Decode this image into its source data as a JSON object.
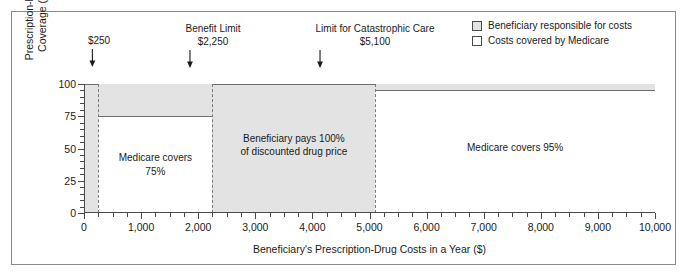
{
  "chart_data": {
    "type": "area",
    "title": "",
    "xlabel": "Beneficiary's Prescription-Drug Costs in a Year ($)",
    "ylabel_line1": "Prescription-Drug",
    "ylabel_line2": "Coverage (%)",
    "xlim": [
      0,
      10000
    ],
    "ylim": [
      0,
      100
    ],
    "xticks": [
      0,
      1000,
      2000,
      3000,
      4000,
      5000,
      6000,
      7000,
      8000,
      9000,
      10000
    ],
    "xtick_labels": [
      "0",
      "1,000",
      "2,000",
      "3,000",
      "4,000",
      "5,000",
      "6,000",
      "7,000",
      "8,000",
      "9,000",
      "10,000"
    ],
    "x_minor_step": 250,
    "yticks": [
      0,
      25,
      50,
      75,
      100
    ],
    "ytick_labels": [
      "0",
      "25",
      "50",
      "75",
      "100"
    ],
    "y_minor_step": 5,
    "grid": false,
    "legend_position": "top-right",
    "series": [
      {
        "name": "Costs covered by Medicare",
        "description": "Medicare prescription-drug coverage as a percent of the beneficiary's annual drug costs",
        "steps": [
          {
            "x_start": 0,
            "x_end": 250,
            "coverage_pct": 0
          },
          {
            "x_start": 250,
            "x_end": 2250,
            "coverage_pct": 75
          },
          {
            "x_start": 2250,
            "x_end": 5100,
            "coverage_pct": 0
          },
          {
            "x_start": 5100,
            "x_end": 10000,
            "coverage_pct": 95
          }
        ]
      },
      {
        "name": "Beneficiary responsible for costs",
        "description": "Shaded area above the coverage line; share of drug costs paid by the beneficiary",
        "steps": [
          {
            "x_start": 0,
            "x_end": 250,
            "beneficiary_pct": 100
          },
          {
            "x_start": 250,
            "x_end": 2250,
            "beneficiary_pct": 25
          },
          {
            "x_start": 2250,
            "x_end": 5100,
            "beneficiary_pct": 100
          },
          {
            "x_start": 5100,
            "x_end": 10000,
            "beneficiary_pct": 5
          }
        ]
      }
    ],
    "thresholds": [
      {
        "x": 250,
        "title": "",
        "value_label": "$250"
      },
      {
        "x": 2250,
        "title": "Benefit Limit",
        "value_label": "$2,250"
      },
      {
        "x": 5100,
        "title": "Limit for Catastrophic Care",
        "value_label": "$5,100"
      }
    ],
    "annotations": [
      {
        "x_center": 1250,
        "line1": "Medicare covers",
        "line2": "75%"
      },
      {
        "x_center": 3675,
        "line1": "Beneficiary pays 100%",
        "line2": "of discounted drug price"
      },
      {
        "x_center": 7550,
        "line1": "Medicare covers 95%",
        "line2": ""
      }
    ],
    "legend": [
      {
        "label": "Beneficiary responsible for costs",
        "swatch": "filled",
        "color": "#e3e3e3"
      },
      {
        "label": "Costs covered by Medicare",
        "swatch": "empty",
        "color": "#ffffff"
      }
    ],
    "colors": {
      "shaded_region": "#e3e3e3",
      "covered_region": "#ffffff",
      "axis": "#4a4a4a",
      "step_line": "#6e6e6e",
      "threshold_line": "#7a7a7a",
      "frame": "#8b8b8b"
    }
  }
}
